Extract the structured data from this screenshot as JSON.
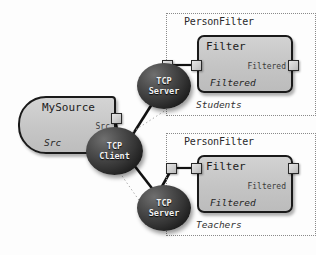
{
  "diagram": {
    "colors": {
      "node_fill_dark": "#343434",
      "box_fill": "#c6c6c6",
      "outline": "#1a1a1a",
      "group_border": "#8a8a8a",
      "wire": "#121212",
      "dotted_wire": "#9a9a9a",
      "node_text": "#f2f2f2"
    },
    "source": {
      "name": "MySource",
      "port_label": "Src",
      "interface_label": "Src"
    },
    "nodes": [
      {
        "id": "tcp-client",
        "line1": "TCP",
        "line2": "Client"
      },
      {
        "id": "tcp-server-top",
        "line1": "TCP",
        "line2": "Server"
      },
      {
        "id": "tcp-server-bottom",
        "line1": "TCP",
        "line2": "Server"
      }
    ],
    "groups": [
      {
        "id": "students",
        "title": "PersonFilter",
        "footer": "Students",
        "filter": {
          "name": "Filter",
          "port_label": "Filtered",
          "interface_label": "Filtered"
        }
      },
      {
        "id": "teachers",
        "title": "PersonFilter",
        "footer": "Teachers",
        "filter": {
          "name": "Filter",
          "port_label": "Filtered",
          "interface_label": "Filtered"
        }
      }
    ],
    "ports": [
      {
        "id": "source-out-port"
      },
      {
        "id": "server-top-in-port"
      },
      {
        "id": "filter-top-in-port"
      },
      {
        "id": "filter-top-out-port"
      },
      {
        "id": "server-bottom-in-port"
      },
      {
        "id": "filter-bottom-in-port"
      },
      {
        "id": "filter-bottom-out-port"
      }
    ]
  }
}
